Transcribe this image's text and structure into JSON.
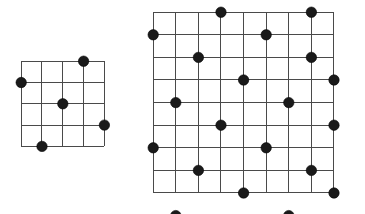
{
  "figure": {
    "title": "",
    "background_color": "#ffffff",
    "width": 365,
    "height": 214
  },
  "style": {
    "grid_line_color": "#4a4a4a",
    "grid_line_width": 1.0,
    "dot_color": "#1a1a1a",
    "dot_radius": 5.2,
    "dot_edge_color": "#000000"
  },
  "chart_data": {
    "type": "scatter",
    "title": "",
    "xlabel": "",
    "ylabel": "",
    "grid_on": true,
    "legend": "none",
    "panels": [
      {
        "name": "left-grid",
        "label": "small-lattice",
        "origin_x": 21,
        "origin_y": 61,
        "cols": 4,
        "rows": 4,
        "cell_width": 20.8,
        "cell_height": 21.3,
        "xlim": [
          0,
          4
        ],
        "ylim": [
          0,
          4
        ],
        "point_count": 5,
        "points": [
          {
            "col": 3,
            "row": 0
          },
          {
            "col": 0,
            "row": 1
          },
          {
            "col": 2,
            "row": 2
          },
          {
            "col": 4,
            "row": 3
          },
          {
            "col": 1,
            "row": 4
          }
        ]
      },
      {
        "name": "right-grid",
        "label": "large-lattice",
        "origin_x": 153,
        "origin_y": 12,
        "cols": 8,
        "rows": 8,
        "cell_width": 22.6,
        "cell_height": 22.6,
        "xlim": [
          0,
          8
        ],
        "ylim": [
          0,
          8
        ],
        "point_count": 20,
        "points": [
          {
            "col": 3,
            "row": 0
          },
          {
            "col": 7,
            "row": 0
          },
          {
            "col": 0,
            "row": 1
          },
          {
            "col": 5,
            "row": 1
          },
          {
            "col": 2,
            "row": 2
          },
          {
            "col": 7,
            "row": 2
          },
          {
            "col": 4,
            "row": 3
          },
          {
            "col": 8,
            "row": 3
          },
          {
            "col": 1,
            "row": 4
          },
          {
            "col": 6,
            "row": 4
          },
          {
            "col": 3,
            "row": 5
          },
          {
            "col": 8,
            "row": 5
          },
          {
            "col": 0,
            "row": 6
          },
          {
            "col": 5,
            "row": 6
          },
          {
            "col": 2,
            "row": 7
          },
          {
            "col": 7,
            "row": 7
          },
          {
            "col": 4,
            "row": 8
          },
          {
            "col": 8,
            "row": 8
          },
          {
            "col": 1,
            "row": 9
          },
          {
            "col": 6,
            "row": 9
          }
        ]
      }
    ]
  }
}
